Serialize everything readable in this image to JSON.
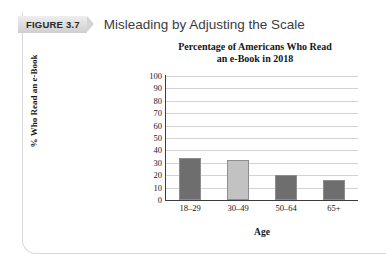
{
  "figure": {
    "badge_label": "FIGURE 3.7",
    "caption": "Misleading by Adjusting the Scale"
  },
  "chart_data": {
    "type": "bar",
    "title": "Percentage of Americans Who Read an e-Book in 2018",
    "title_line1": "Percentage of Americans Who Read",
    "title_line2": "an e-Book in 2018",
    "categories": [
      "18–29",
      "30–49",
      "50–64",
      "65+"
    ],
    "values": [
      34,
      32,
      20,
      16
    ],
    "series": [
      {
        "name": "% Who Read an e-Book",
        "values": [
          34,
          32,
          20,
          16
        ],
        "colors": [
          "#6e6e6e",
          "#c2c2c2",
          "#6e6e6e",
          "#6e6e6e"
        ]
      }
    ],
    "xlabel": "Age",
    "ylabel": "% Who Read an e-Book",
    "ylim": [
      0,
      100
    ],
    "ytick_step": 10,
    "yticks": [
      100,
      90,
      80,
      70,
      60,
      50,
      40,
      30,
      20,
      10,
      0
    ],
    "grid": true,
    "legend": false,
    "bar_color_dark": "#6e6e6e",
    "bar_color_light": "#c2c2c2",
    "gridline_color": "#d3d3d3",
    "axis_color": "#3c3c3c"
  }
}
